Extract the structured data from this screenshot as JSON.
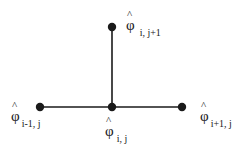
{
  "diagram": {
    "title": "",
    "type": "finite-difference stencil",
    "colors": {
      "node": "#1a1a1a",
      "edge": "#1a1a1a",
      "background": "#ffffff"
    },
    "nodes": [
      {
        "id": "top",
        "symbol": "φ",
        "hat": "^",
        "subscript": "i, j+1",
        "x": 112,
        "y": 27
      },
      {
        "id": "left",
        "symbol": "φ",
        "hat": "^",
        "subscript": "i-1, j",
        "x": 40,
        "y": 107
      },
      {
        "id": "center",
        "symbol": "φ",
        "hat": "^",
        "subscript": "i, j",
        "x": 112,
        "y": 107
      },
      {
        "id": "right",
        "symbol": "φ",
        "hat": "^",
        "subscript": "i+1, j",
        "x": 182,
        "y": 107
      }
    ],
    "edges": [
      {
        "from": "center",
        "to": "top"
      },
      {
        "from": "left",
        "to": "center"
      },
      {
        "from": "center",
        "to": "right"
      }
    ]
  }
}
